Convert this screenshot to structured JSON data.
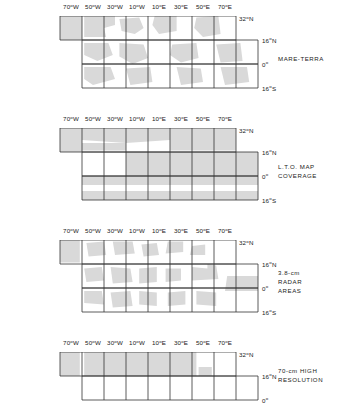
{
  "figure": {
    "background_color": "#ffffff",
    "line_color": "#333333",
    "shade_color": "#d9d9d9",
    "text_color": "#1a1a1a"
  },
  "axes": {
    "longitude_ticks": [
      {
        "label": "70",
        "sup": "o",
        "suffix": "W",
        "lon": -70
      },
      {
        "label": "50",
        "sup": "o",
        "suffix": "W",
        "lon": -50
      },
      {
        "label": "30",
        "sup": "o",
        "suffix": "W",
        "lon": -30
      },
      {
        "label": "10",
        "sup": "o",
        "suffix": "W",
        "lon": -10
      },
      {
        "label": "10",
        "sup": "o",
        "suffix": "E",
        "lon": 10
      },
      {
        "label": "30",
        "sup": "o",
        "suffix": "E",
        "lon": 30
      },
      {
        "label": "50",
        "sup": "o",
        "suffix": "E",
        "lon": 50
      },
      {
        "label": "70",
        "sup": "o",
        "suffix": "E",
        "lon": 70
      }
    ],
    "latitude_ticks": [
      {
        "label": "32",
        "sup": "o",
        "suffix": "N",
        "lat": 32
      },
      {
        "label": "16",
        "sup": "o",
        "suffix": "N",
        "lat": 16
      },
      {
        "label": "0",
        "sup": "o",
        "suffix": "",
        "lat": 0
      },
      {
        "label": "16",
        "sup": "o",
        "suffix": "S",
        "lat": -16
      }
    ],
    "lon_range": [
      -80,
      80
    ],
    "lat_range": [
      -16,
      32
    ]
  },
  "panels": [
    {
      "id": "mare-terra",
      "caption": "MARE-TERRA",
      "top": 16,
      "rows": [
        {
          "lat_top": 32,
          "lat_bottom": 16,
          "lon_left": -80,
          "lon_right": 80
        },
        {
          "lat_top": 16,
          "lat_bottom": 0,
          "lon_left": -60,
          "lon_right": 100
        },
        {
          "lat_top": 0,
          "lat_bottom": -16,
          "lon_left": -60,
          "lon_right": 100
        }
      ]
    },
    {
      "id": "lto-map-coverage",
      "caption": "L.T.O. MAP\nCOVERAGE",
      "top": 128,
      "rows": [
        {
          "lat_top": 32,
          "lat_bottom": 16,
          "lon_left": -80,
          "lon_right": 80
        },
        {
          "lat_top": 16,
          "lat_bottom": 0,
          "lon_left": -60,
          "lon_right": 100
        },
        {
          "lat_top": 0,
          "lat_bottom": -16,
          "lon_left": -60,
          "lon_right": 100
        }
      ]
    },
    {
      "id": "radar-areas",
      "caption": "3.8-cm\nRADAR\nAREAS",
      "top": 240,
      "rows": [
        {
          "lat_top": 32,
          "lat_bottom": 16,
          "lon_left": -80,
          "lon_right": 80
        },
        {
          "lat_top": 16,
          "lat_bottom": 0,
          "lon_left": -60,
          "lon_right": 100
        },
        {
          "lat_top": 0,
          "lat_bottom": -16,
          "lon_left": -60,
          "lon_right": 100
        }
      ]
    },
    {
      "id": "high-resolution",
      "caption": "70-cm HIGH\nRESOLUTION",
      "top": 352,
      "rows": [
        {
          "lat_top": 32,
          "lat_bottom": 16,
          "lon_left": -80,
          "lon_right": 80
        },
        {
          "lat_top": 16,
          "lat_bottom": 0,
          "lon_left": -60,
          "lon_right": 100
        }
      ]
    }
  ],
  "shading": {
    "mare-terra": [
      [
        [
          -80,
          32
        ],
        [
          -60,
          32
        ],
        [
          -60,
          16
        ],
        [
          -80,
          16
        ]
      ],
      [
        [
          -58,
          32
        ],
        [
          -30,
          32
        ],
        [
          -30,
          26
        ],
        [
          -40,
          24
        ],
        [
          -38,
          18
        ],
        [
          -58,
          18
        ]
      ],
      [
        [
          -26,
          30
        ],
        [
          -8,
          31
        ],
        [
          -4,
          24
        ],
        [
          -12,
          20
        ],
        [
          -24,
          22
        ]
      ],
      [
        [
          6,
          32
        ],
        [
          26,
          32
        ],
        [
          26,
          22
        ],
        [
          10,
          20
        ],
        [
          4,
          26
        ]
      ],
      [
        [
          44,
          31
        ],
        [
          64,
          32
        ],
        [
          66,
          20
        ],
        [
          50,
          18
        ],
        [
          42,
          24
        ]
      ],
      [
        [
          -58,
          14
        ],
        [
          -36,
          14
        ],
        [
          -32,
          6
        ],
        [
          -46,
          2
        ],
        [
          -58,
          6
        ]
      ],
      [
        [
          -26,
          14
        ],
        [
          -4,
          13
        ],
        [
          0,
          4
        ],
        [
          -14,
          0
        ],
        [
          -26,
          5
        ]
      ],
      [
        [
          22,
          13
        ],
        [
          44,
          14
        ],
        [
          46,
          4
        ],
        [
          30,
          1
        ],
        [
          20,
          6
        ]
      ],
      [
        [
          62,
          13
        ],
        [
          84,
          14
        ],
        [
          86,
          2
        ],
        [
          66,
          1
        ]
      ],
      [
        [
          -58,
          -2
        ],
        [
          -34,
          -2
        ],
        [
          -30,
          -10
        ],
        [
          -50,
          -14
        ],
        [
          -58,
          -10
        ]
      ],
      [
        [
          -20,
          -3
        ],
        [
          2,
          -2
        ],
        [
          4,
          -12
        ],
        [
          -16,
          -14
        ]
      ],
      [
        [
          26,
          -2
        ],
        [
          48,
          -3
        ],
        [
          50,
          -12
        ],
        [
          30,
          -14
        ]
      ],
      [
        [
          66,
          -2
        ],
        [
          90,
          -2
        ],
        [
          92,
          -12
        ],
        [
          70,
          -14
        ]
      ]
    ],
    "lto-map-coverage": [
      [
        [
          -80,
          32
        ],
        [
          -60,
          32
        ],
        [
          -60,
          16
        ],
        [
          -80,
          16
        ]
      ],
      [
        [
          -60,
          32
        ],
        [
          20,
          32
        ],
        [
          20,
          24
        ],
        [
          -20,
          22
        ],
        [
          -60,
          24
        ]
      ],
      [
        [
          -60,
          22
        ],
        [
          -20,
          22
        ],
        [
          -20,
          17
        ],
        [
          -60,
          17
        ]
      ],
      [
        [
          20,
          32
        ],
        [
          80,
          32
        ],
        [
          80,
          17
        ],
        [
          20,
          17
        ]
      ],
      [
        [
          -20,
          16
        ],
        [
          100,
          16
        ],
        [
          100,
          0
        ],
        [
          -20,
          0
        ]
      ],
      [
        [
          -60,
          0
        ],
        [
          100,
          0
        ],
        [
          100,
          -6
        ],
        [
          -60,
          -6
        ]
      ],
      [
        [
          -60,
          -10
        ],
        [
          100,
          -10
        ],
        [
          100,
          -16
        ],
        [
          -60,
          -16
        ]
      ]
    ],
    "radar-areas": [
      [
        [
          -80,
          32
        ],
        [
          -62,
          32
        ],
        [
          -62,
          17
        ],
        [
          -80,
          17
        ]
      ],
      [
        [
          -56,
          30
        ],
        [
          -40,
          31
        ],
        [
          -38,
          22
        ],
        [
          -54,
          21
        ]
      ],
      [
        [
          -32,
          31
        ],
        [
          -14,
          31
        ],
        [
          -12,
          23
        ],
        [
          -30,
          22
        ]
      ],
      [
        [
          -6,
          29
        ],
        [
          8,
          30
        ],
        [
          10,
          22
        ],
        [
          -4,
          21
        ]
      ],
      [
        [
          18,
          31
        ],
        [
          32,
          31
        ],
        [
          32,
          24
        ],
        [
          16,
          23
        ]
      ],
      [
        [
          40,
          28
        ],
        [
          52,
          29
        ],
        [
          52,
          22
        ],
        [
          38,
          22
        ]
      ],
      [
        [
          -58,
          13
        ],
        [
          -42,
          14
        ],
        [
          -40,
          5
        ],
        [
          -56,
          4
        ]
      ],
      [
        [
          -34,
          14
        ],
        [
          -16,
          13
        ],
        [
          -14,
          4
        ],
        [
          -32,
          3
        ]
      ],
      [
        [
          -8,
          13
        ],
        [
          8,
          14
        ],
        [
          8,
          4
        ],
        [
          -8,
          3
        ]
      ],
      [
        [
          16,
          13
        ],
        [
          30,
          13
        ],
        [
          30,
          5
        ],
        [
          16,
          4
        ]
      ],
      [
        [
          40,
          14
        ],
        [
          54,
          13
        ],
        [
          54,
          16
        ],
        [
          62,
          15
        ],
        [
          64,
          6
        ],
        [
          40,
          5
        ]
      ],
      [
        [
          72,
          8
        ],
        [
          100,
          8
        ],
        [
          100,
          -2
        ],
        [
          70,
          -2
        ]
      ],
      [
        [
          -58,
          -2
        ],
        [
          -42,
          -2
        ],
        [
          -40,
          -11
        ],
        [
          -58,
          -10
        ]
      ],
      [
        [
          -34,
          -3
        ],
        [
          -16,
          -2
        ],
        [
          -14,
          -12
        ],
        [
          -32,
          -13
        ]
      ],
      [
        [
          -8,
          -2
        ],
        [
          8,
          -3
        ],
        [
          8,
          -12
        ],
        [
          -8,
          -11
        ]
      ],
      [
        [
          18,
          -3
        ],
        [
          34,
          -2
        ],
        [
          34,
          -11
        ],
        [
          18,
          -12
        ]
      ],
      [
        [
          44,
          -2
        ],
        [
          62,
          -3
        ],
        [
          62,
          -12
        ],
        [
          44,
          -11
        ]
      ]
    ],
    "high-resolution": [
      [
        [
          -80,
          32
        ],
        [
          -62,
          32
        ],
        [
          -62,
          16
        ],
        [
          -80,
          16
        ]
      ],
      [
        [
          -58,
          32
        ],
        [
          44,
          32
        ],
        [
          44,
          16
        ],
        [
          -58,
          16
        ]
      ],
      [
        [
          46,
          22
        ],
        [
          58,
          22
        ],
        [
          58,
          16
        ],
        [
          46,
          16
        ]
      ]
    ]
  }
}
